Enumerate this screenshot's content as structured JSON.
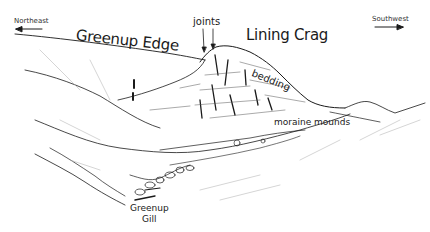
{
  "diagram": {
    "type": "annotated landscape field sketch",
    "orientation": {
      "left": {
        "label": "Northeast",
        "arrow": "left"
      },
      "right": {
        "label": "Southwest",
        "arrow": "right"
      }
    },
    "labels": {
      "ridge": "Greenup Edge",
      "crag": "Lining Crag",
      "joints": "joints",
      "bedding": "bedding",
      "moraine": "moraine mounds",
      "gill_line1": "Greenup",
      "gill_line2": "Gill"
    },
    "colors": {
      "ink": "#1a1a1a",
      "light_ink": "#9a9a9a",
      "background": "#ffffff"
    }
  }
}
